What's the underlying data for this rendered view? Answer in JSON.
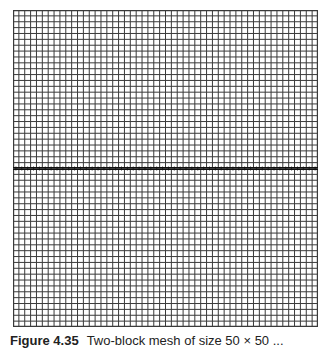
{
  "figure": {
    "caption_label": "Figure 4.35",
    "caption_text": "Two-block mesh of size 50 × 50 ...",
    "mesh": {
      "columns": 52,
      "rows_top_block": 27,
      "rows_bottom_block": 27,
      "line_color": "#3a3a3a",
      "interface_color": "#111111",
      "background": "#ffffff"
    }
  }
}
